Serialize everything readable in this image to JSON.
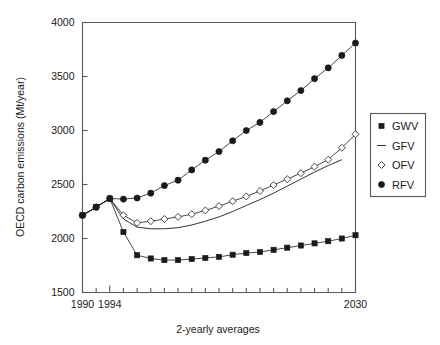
{
  "chart_data": {
    "type": "line",
    "title": "",
    "xlabel": "2-yearly averages",
    "ylabel": "OECD carbon emissions (Mt/year)",
    "xlim": [
      1990,
      2030
    ],
    "ylim": [
      1500,
      4000
    ],
    "ytick_labels": [
      "1500",
      "2000",
      "2500",
      "3000",
      "3500",
      "4000"
    ],
    "ytick_values": [
      1500,
      2000,
      2500,
      3000,
      3500,
      4000
    ],
    "xtick_labels": [
      "1990",
      "1994",
      "2030"
    ],
    "xtick_values": [
      1990,
      1994,
      2030
    ],
    "xtick_all": [
      1990,
      1992,
      1994,
      1996,
      1998,
      2000,
      2002,
      2004,
      2006,
      2008,
      2010,
      2012,
      2014,
      2016,
      2018,
      2020,
      2022,
      2024,
      2026,
      2028,
      2030
    ],
    "grid": false,
    "legend_position": "right",
    "x": [
      1990,
      1992,
      1994,
      1996,
      1998,
      2000,
      2002,
      2004,
      2006,
      2008,
      2010,
      2012,
      2014,
      2016,
      2018,
      2020,
      2022,
      2024,
      2026,
      2028,
      2030
    ],
    "series": [
      {
        "name": "GWV",
        "marker": "filled-square",
        "values": [
          2215,
          2290,
          2370,
          2060,
          1845,
          1815,
          1800,
          1800,
          1810,
          1820,
          1830,
          1850,
          1865,
          1875,
          1895,
          1915,
          1935,
          1955,
          1975,
          2000,
          2030
        ]
      },
      {
        "name": "GFV",
        "marker": "line",
        "values": [
          2215,
          2290,
          2370,
          2180,
          2105,
          2090,
          2090,
          2100,
          2125,
          2160,
          2200,
          2250,
          2305,
          2360,
          2420,
          2485,
          2550,
          2615,
          2675,
          2730,
          null
        ]
      },
      {
        "name": "OFV",
        "marker": "open-diamond",
        "values": [
          2215,
          2290,
          2370,
          2215,
          2145,
          2160,
          2180,
          2200,
          2225,
          2260,
          2300,
          2345,
          2390,
          2440,
          2495,
          2550,
          2605,
          2665,
          2730,
          2840,
          2965
        ]
      },
      {
        "name": "RFV",
        "marker": "filled-circle",
        "values": [
          2215,
          2290,
          2370,
          2365,
          2375,
          2420,
          2490,
          2540,
          2635,
          2725,
          2805,
          2905,
          3000,
          3075,
          3175,
          3275,
          3370,
          3480,
          3580,
          3695,
          3810
        ]
      }
    ]
  },
  "legend": {
    "items": [
      {
        "label": "GWV",
        "marker": "filled-square"
      },
      {
        "label": "GFV",
        "marker": "line"
      },
      {
        "label": "OFV",
        "marker": "open-diamond"
      },
      {
        "label": "RFV",
        "marker": "filled-circle"
      }
    ]
  },
  "colors": {
    "ink": "#1a1a1a",
    "axis": "#555a5d",
    "background": "#ffffff"
  }
}
